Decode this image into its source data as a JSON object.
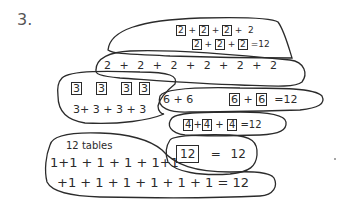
{
  "problem_number": "3.",
  "groups": {
    "twos_grouped": {
      "line1": [
        "2",
        "+",
        "2",
        "+",
        "2",
        "+",
        "2"
      ],
      "line2": [
        "2",
        "+",
        "2",
        "+",
        "2",
        "=12"
      ],
      "boxed_values": "2"
    },
    "twos_sum": {
      "text": "2 + 2 + 2 + 2 + 2 + 2"
    },
    "threes": {
      "boxes": [
        "3",
        "3",
        "3",
        "3"
      ],
      "sum": "3+ 3 + 3 + 3"
    },
    "sixes": {
      "sum": "6 + 6",
      "boxed_left": "6",
      "plus": "+",
      "boxed_right": "6",
      "result": "=12"
    },
    "fours": {
      "boxes": [
        "4",
        "4",
        "4"
      ],
      "plus": "+",
      "result": "=12"
    },
    "twelve": {
      "boxed": "12",
      "result": "= 12"
    },
    "ones": {
      "label": "12 tables",
      "line1": "1+1 + 1 + 1 + 1+1",
      "line2": "+1 + 1 + 1 + 1 + 1 + 1  = 12"
    }
  },
  "colors": {
    "ink": "#2b2b2b",
    "paper": "#ffffff"
  }
}
